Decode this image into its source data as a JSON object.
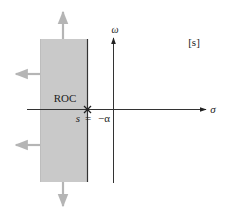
{
  "diagram": {
    "plane_label": "[s]",
    "axes": {
      "horizontal_label": "σ",
      "vertical_label": "ω"
    },
    "region": {
      "label": "ROC",
      "fill_color": "#c9c9c9",
      "boundary_color": "#333333",
      "arrow_color": "#b5b5b5"
    },
    "pole": {
      "marker": "×",
      "var_label": "s",
      "equals": "=",
      "value_label": "−α"
    },
    "colors": {
      "axis": "#333333",
      "text": "#222222",
      "background": "#ffffff"
    }
  }
}
